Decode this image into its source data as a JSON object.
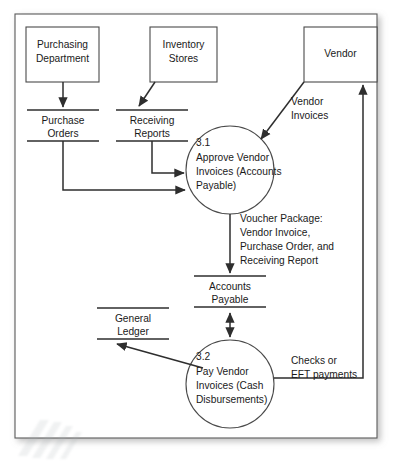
{
  "diagram": {
    "stroke_color": "#3a3a3a",
    "text_color": "#1a1a1a",
    "background_color": "#ffffff",
    "entities": [
      {
        "id": "purchasing-department",
        "lines": [
          "Purchasing",
          "Department"
        ]
      },
      {
        "id": "inventory-stores",
        "lines": [
          "Inventory",
          "Stores"
        ]
      },
      {
        "id": "vendor",
        "lines": [
          "Vendor"
        ]
      }
    ],
    "data_stores": [
      {
        "id": "purchase-orders",
        "lines": [
          "Purchase",
          "Orders"
        ]
      },
      {
        "id": "receiving-reports",
        "lines": [
          "Receiving",
          "Reports"
        ]
      },
      {
        "id": "accounts-payable",
        "lines": [
          "Accounts",
          "Payable"
        ]
      },
      {
        "id": "general-ledger",
        "lines": [
          "General",
          "Ledger"
        ]
      }
    ],
    "processes": [
      {
        "id": "process-3-1",
        "number": "3.1",
        "lines": [
          "Approve Vendor",
          "Invoices (Accounts",
          "Payable)"
        ]
      },
      {
        "id": "process-3-2",
        "number": "3.2",
        "lines": [
          "Pay Vendor",
          "Invoices (Cash",
          "Disbursements)"
        ]
      }
    ],
    "flow_labels": [
      {
        "id": "vendor-invoices",
        "lines": [
          "Vendor",
          "Invoices"
        ]
      },
      {
        "id": "voucher-package",
        "lines": [
          "Voucher Package:",
          "Vendor Invoice,",
          "Purchase Order, and",
          "Receiving Report"
        ]
      },
      {
        "id": "checks-or-eft-payments",
        "lines": [
          "Checks or",
          "EFT payments"
        ]
      }
    ]
  }
}
